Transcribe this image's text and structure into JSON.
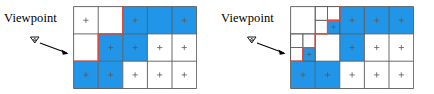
{
  "figure": {
    "panel_count": 2,
    "colors": {
      "visible_cell": "#2196e8",
      "occluded_cell": "#ffffff",
      "grid_line": "#595959",
      "boundary_line": "#ee4433",
      "marker": "#5a5a5a",
      "text": "#000000",
      "arrow": "#000000"
    }
  },
  "panels": [
    {
      "id": "left",
      "name": "uniform-grid-panel",
      "viewpoint_label": "Viewpoint",
      "viewpoint_icon": "eye-marker-icon",
      "arrow_icon": "arrow-right-icon",
      "grid": {
        "type": "uniform",
        "columns": 5,
        "rows": 3,
        "cell_width": 24.6,
        "cell_height": 27.3,
        "origin_x": 0,
        "origin_y": 0,
        "cells": [
          {
            "col": 0,
            "row": 0,
            "state": "occluded",
            "marker": "plus"
          },
          {
            "col": 1,
            "row": 0,
            "state": "occluded",
            "marker": "none"
          },
          {
            "col": 2,
            "row": 0,
            "state": "visible",
            "marker": "plus"
          },
          {
            "col": 3,
            "row": 0,
            "state": "visible",
            "marker": "none"
          },
          {
            "col": 4,
            "row": 0,
            "state": "visible",
            "marker": "plus"
          },
          {
            "col": 0,
            "row": 1,
            "state": "occluded",
            "marker": "none"
          },
          {
            "col": 1,
            "row": 1,
            "state": "visible",
            "marker": "plus"
          },
          {
            "col": 2,
            "row": 1,
            "state": "visible",
            "marker": "plus"
          },
          {
            "col": 3,
            "row": 1,
            "state": "occluded",
            "marker": "plus"
          },
          {
            "col": 4,
            "row": 1,
            "state": "occluded",
            "marker": "plus"
          },
          {
            "col": 0,
            "row": 2,
            "state": "visible",
            "marker": "plus"
          },
          {
            "col": 1,
            "row": 2,
            "state": "visible",
            "marker": "plus"
          },
          {
            "col": 2,
            "row": 2,
            "state": "occluded",
            "marker": "plus"
          },
          {
            "col": 3,
            "row": 2,
            "state": "occluded",
            "marker": "plus"
          },
          {
            "col": 4,
            "row": 2,
            "state": "occluded",
            "marker": "plus"
          }
        ],
        "boundary_path": "M 0,54.6 L 24.6,54.6 L 24.6,27.3 L 49.2,27.3 L 49.2,0"
      }
    },
    {
      "id": "right",
      "name": "subdivided-grid-panel",
      "viewpoint_label": "Viewpoint",
      "viewpoint_icon": "eye-marker-icon",
      "arrow_icon": "arrow-right-icon",
      "grid": {
        "type": "subdivided",
        "columns": 5,
        "rows": 3,
        "cell_width": 24.6,
        "cell_height": 27.3,
        "origin_x": 0,
        "origin_y": 0,
        "cells": [
          {
            "col": 0,
            "row": 0,
            "state": "occluded",
            "marker": "none"
          },
          {
            "col": 2,
            "row": 0,
            "state": "visible",
            "marker": "plus"
          },
          {
            "col": 3,
            "row": 0,
            "state": "visible",
            "marker": "plus"
          },
          {
            "col": 4,
            "row": 0,
            "state": "visible",
            "marker": "plus"
          },
          {
            "col": 2,
            "row": 1,
            "state": "visible",
            "marker": "plus"
          },
          {
            "col": 3,
            "row": 1,
            "state": "occluded",
            "marker": "plus"
          },
          {
            "col": 4,
            "row": 1,
            "state": "occluded",
            "marker": "plus"
          },
          {
            "col": 0,
            "row": 2,
            "state": "visible",
            "marker": "plus"
          },
          {
            "col": 1,
            "row": 2,
            "state": "visible",
            "marker": "plus"
          },
          {
            "col": 2,
            "row": 2,
            "state": "occluded",
            "marker": "plus"
          },
          {
            "col": 3,
            "row": 2,
            "state": "occluded",
            "marker": "plus"
          },
          {
            "col": 4,
            "row": 2,
            "state": "occluded",
            "marker": "plus"
          }
        ],
        "subcells": [
          {
            "x": 24.6,
            "y": 0,
            "w": 12.3,
            "h": 13.65,
            "state": "occluded",
            "marker": "none"
          },
          {
            "x": 36.9,
            "y": 0,
            "w": 12.3,
            "h": 13.65,
            "state": "occluded",
            "marker": "none"
          },
          {
            "x": 24.6,
            "y": 13.65,
            "w": 12.3,
            "h": 13.65,
            "state": "occluded",
            "marker": "none"
          },
          {
            "x": 36.9,
            "y": 13.65,
            "w": 12.3,
            "h": 13.65,
            "state": "visible",
            "marker": "plus"
          },
          {
            "x": 0,
            "y": 27.3,
            "w": 12.3,
            "h": 13.65,
            "state": "occluded",
            "marker": "none"
          },
          {
            "x": 12.3,
            "y": 27.3,
            "w": 12.3,
            "h": 13.65,
            "state": "occluded",
            "marker": "none"
          },
          {
            "x": 0,
            "y": 40.95,
            "w": 12.3,
            "h": 13.65,
            "state": "occluded",
            "marker": "none"
          },
          {
            "x": 12.3,
            "y": 40.95,
            "w": 12.3,
            "h": 13.65,
            "state": "visible",
            "marker": "plus"
          }
        ],
        "boundary_path": "M 0,54.6 L 12.3,54.6 L 12.3,40.95 L 24.6,40.95 L 24.6,27.3 L 36.9,27.3 L 36.9,13.65 L 49.2,13.65 L 49.2,0"
      }
    }
  ]
}
